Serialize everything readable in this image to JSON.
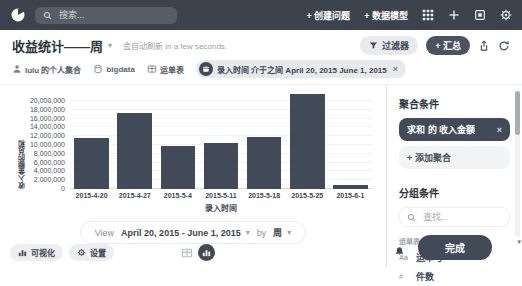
{
  "colors": {
    "topnav_bg": "#3d434d",
    "bar": "#424a57",
    "dark_pill": "#424a57",
    "summarize_bg": "#4c5360"
  },
  "icons": {
    "chevron_down": "▾",
    "close": "×"
  },
  "topnav": {
    "search_placeholder": "搜索...",
    "create_question_label": "+ 创建问题",
    "data_model_label": "+ 数据模型"
  },
  "header": {
    "title": "收益统计——周",
    "refresh_note": "会自动刷新 in a few seconds.",
    "filter_button_label": "过滤器",
    "summarize_button_label": "+ 汇总"
  },
  "breadcrumbs": {
    "collection": "lulu 的个人集合",
    "database": "bigdata",
    "table": "运单表"
  },
  "filter_pill": {
    "text": "录入时间 介于之间 April 20, 2015 June 1, 2015"
  },
  "chart_data": {
    "type": "bar",
    "title": "",
    "categories": [
      "2015-4-20",
      "2015-4-27",
      "2015-5-4",
      "2015-5-11",
      "2015-5-18",
      "2015-5-25",
      "2015-6-1"
    ],
    "values": [
      11600000,
      17200000,
      9700000,
      10400000,
      11900000,
      21700000,
      900000
    ],
    "xlabel": "录入时间",
    "ylabel": "收入金额的总和",
    "ylim": [
      0,
      20000000
    ],
    "ytick_values": [
      0,
      2000000,
      4000000,
      6000000,
      8000000,
      10000000,
      12000000,
      14000000,
      16000000,
      18000000,
      20000000
    ],
    "grid": true,
    "legend": false,
    "bar_color": "#424a57"
  },
  "view_bar": {
    "view_label": "View",
    "range_value": "April 20, 2015 - June 1, 2015",
    "by_label": "by",
    "granularity_value": "周"
  },
  "footer": {
    "visualization_label": "可视化",
    "settings_label": "设置"
  },
  "sidebar": {
    "aggregation_heading": "聚合条件",
    "aggregation_pill": "求和 的 收入金额",
    "add_aggregation_label": "+ 添加聚合",
    "groupby_heading": "分组条件",
    "search_placeholder": "查找...",
    "table_label": "运单表",
    "fields": [
      {
        "type": "Aa",
        "name": "运单号"
      },
      {
        "type": "#",
        "name": "件数"
      }
    ],
    "done_button_label": "完成"
  }
}
